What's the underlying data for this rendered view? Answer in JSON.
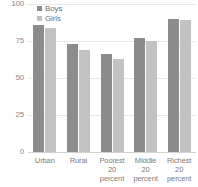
{
  "chart_data": {
    "type": "bar",
    "title": "",
    "subtitle": "",
    "xlabel": "",
    "ylabel": "",
    "ylim": [
      0,
      100
    ],
    "yticks": [
      0,
      25,
      50,
      75,
      100
    ],
    "ytick_labels": [
      "0",
      "25",
      "50",
      "75",
      "100"
    ],
    "grid": true,
    "legend_position": "top-left",
    "categories": [
      "Urban",
      "Rural",
      "Poorest 20 percent",
      "Middle 20 percent",
      "Richest 20 percent"
    ],
    "category_lines": [
      [
        "Urban"
      ],
      [
        "Rural"
      ],
      [
        "Poorest",
        "20",
        "percent"
      ],
      [
        "Middle",
        "20",
        "percent"
      ],
      [
        "Richest",
        "20",
        "percent"
      ]
    ],
    "series": [
      {
        "name": "Boys",
        "color": "#8c8c8c",
        "values": [
          86,
          73,
          66,
          77,
          90
        ]
      },
      {
        "name": "Girls",
        "color": "#c2c2c2",
        "values": [
          84,
          69,
          63,
          75,
          89
        ]
      }
    ]
  },
  "colors": {
    "boys": "#8c8c8c",
    "girls": "#c2c2c2",
    "gridline": "#e8e8e8",
    "axis": "#d2d2d2",
    "tick_text": "#8a8a8a",
    "label_text": "#7d7d7d",
    "background": "#ffffff"
  }
}
